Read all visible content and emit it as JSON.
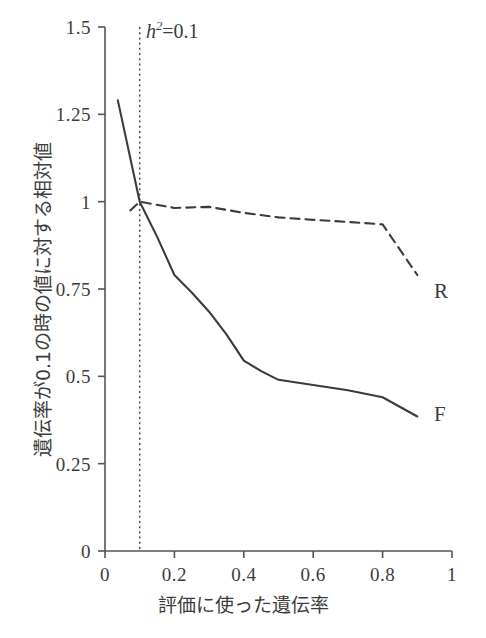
{
  "chart_data": {
    "type": "line",
    "title": "",
    "xlabel": "評価に使った遺伝率",
    "ylabel": "遺伝率が0.1の時の値に対する相対値",
    "xlim": [
      0,
      1
    ],
    "ylim": [
      0,
      1.5
    ],
    "grid": false,
    "legend_position": "inline-right-end",
    "xticks": [
      "0",
      "0.2",
      "0.4",
      "0.6",
      "0.8",
      "1"
    ],
    "xtick_values": [
      0,
      0.2,
      0.4,
      0.6,
      0.8,
      1
    ],
    "yticks": [
      "0",
      "0.25",
      "0.5",
      "0.75",
      "1",
      "1.25",
      "1.5"
    ],
    "ytick_values": [
      0,
      0.25,
      0.5,
      0.75,
      1,
      1.25,
      1.5
    ],
    "annotations": [
      {
        "name": "reference-line-label",
        "text": "h2=0.1",
        "text_parts": {
          "symbol": "h",
          "exponent": "2",
          "equals": "=",
          "value": "0.1"
        },
        "x": 0.1,
        "type": "vertical-dotted-line"
      }
    ],
    "series": [
      {
        "name": "F",
        "label": "F",
        "style": "solid",
        "color": "#3c3c3c",
        "x": [
          0.037,
          0.1,
          0.15,
          0.2,
          0.25,
          0.3,
          0.35,
          0.4,
          0.45,
          0.5,
          0.6,
          0.7,
          0.8,
          0.9
        ],
        "values": [
          1.29,
          1.0,
          0.9,
          0.79,
          0.74,
          0.685,
          0.62,
          0.545,
          0.515,
          0.49,
          0.475,
          0.46,
          0.44,
          0.385
        ]
      },
      {
        "name": "R",
        "label": "R",
        "style": "dashed",
        "color": "#3c3c3c",
        "x": [
          0.073,
          0.1,
          0.2,
          0.3,
          0.4,
          0.5,
          0.6,
          0.7,
          0.8,
          0.9
        ],
        "values": [
          0.975,
          1.0,
          0.982,
          0.985,
          0.968,
          0.955,
          0.948,
          0.942,
          0.935,
          0.79
        ]
      }
    ]
  },
  "labels": {
    "series_R": "R",
    "series_F": "F"
  }
}
